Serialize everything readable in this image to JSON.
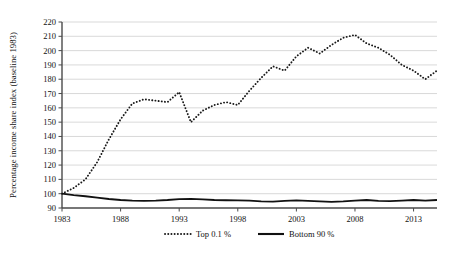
{
  "chart_data": {
    "type": "line",
    "title": "",
    "xlabel": "",
    "ylabel": "Percentage income share index (baseline 1983)",
    "xlim": [
      1983,
      2015
    ],
    "ylim": [
      90,
      220
    ],
    "ytick_step": 10,
    "yticks": [
      90,
      100,
      110,
      120,
      130,
      140,
      150,
      160,
      170,
      180,
      190,
      200,
      210,
      220
    ],
    "xticks": [
      1983,
      1988,
      1993,
      1998,
      2003,
      2008,
      2013
    ],
    "grid": "horizontal",
    "legend_position": "bottom-center",
    "x": [
      1983,
      1984,
      1985,
      1986,
      1987,
      1988,
      1989,
      1990,
      1991,
      1992,
      1993,
      1994,
      1995,
      1996,
      1997,
      1998,
      1999,
      2000,
      2001,
      2002,
      2003,
      2004,
      2005,
      2006,
      2007,
      2008,
      2009,
      2010,
      2011,
      2012,
      2013,
      2014,
      2015
    ],
    "series": [
      {
        "name": "Top 0.1 %",
        "style": "dotted",
        "color": "#1a1a1a",
        "values": [
          100,
          104,
          110,
          122,
          138,
          152,
          163,
          166,
          165,
          164,
          171,
          150,
          158,
          162,
          164,
          162,
          172,
          181,
          189,
          186,
          196,
          202,
          198,
          204,
          209,
          211,
          205,
          202,
          197,
          190,
          186,
          180,
          186
        ]
      },
      {
        "name": "Bottom 90 %",
        "style": "solid",
        "color": "#111111",
        "values": [
          100,
          99,
          98.2,
          97.2,
          96.3,
          95.6,
          95.2,
          95.0,
          95.2,
          95.6,
          96.2,
          96.4,
          96.0,
          95.6,
          95.4,
          95.3,
          95.2,
          94.7,
          94.4,
          95.0,
          95.3,
          95.0,
          94.6,
          94.3,
          94.6,
          95.2,
          95.6,
          95.0,
          94.8,
          95.2,
          95.6,
          95.2,
          95.6
        ]
      }
    ]
  },
  "legend": {
    "entries": [
      {
        "label": "Top 0.1 %",
        "marker": "dotted-line-marker"
      },
      {
        "label": "Bottom 90 %",
        "marker": "solid-line-marker"
      }
    ]
  },
  "axis_title": {
    "y": "Percentage income share index (baseline 1983)"
  }
}
